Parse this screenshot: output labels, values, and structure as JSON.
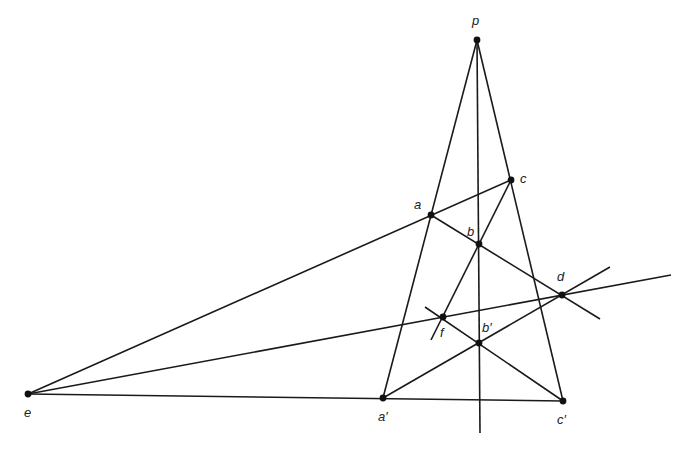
{
  "diagram": {
    "type": "projective-geometry-construction",
    "colors": {
      "line": "#1a1a1a",
      "point": "#111111",
      "label": "#222222"
    },
    "points": [
      {
        "id": "p",
        "label": "p",
        "x": 477,
        "y": 40,
        "lx": 472,
        "ly": 14
      },
      {
        "id": "c",
        "label": "c",
        "x": 511,
        "y": 180,
        "lx": 520,
        "ly": 172
      },
      {
        "id": "a",
        "label": "a",
        "x": 431,
        "y": 215,
        "lx": 414,
        "ly": 198
      },
      {
        "id": "b",
        "label": "b",
        "x": 479,
        "y": 244,
        "lx": 467,
        "ly": 225
      },
      {
        "id": "d",
        "label": "d",
        "x": 562,
        "y": 295,
        "lx": 557,
        "ly": 270
      },
      {
        "id": "f",
        "label": "f",
        "x": 443,
        "y": 317,
        "lx": 440,
        "ly": 326
      },
      {
        "id": "b2",
        "label": "b′",
        "x": 479,
        "y": 343,
        "lx": 482,
        "ly": 321
      },
      {
        "id": "e",
        "label": "e",
        "x": 28,
        "y": 394,
        "lx": 24,
        "ly": 406
      },
      {
        "id": "a2",
        "label": "a′",
        "x": 383,
        "y": 398,
        "lx": 378,
        "ly": 410
      },
      {
        "id": "c2",
        "label": "c′",
        "x": 563,
        "y": 401,
        "lx": 557,
        "ly": 413
      }
    ],
    "lines": [
      {
        "from": [
          477,
          40
        ],
        "to": [
          383,
          398
        ]
      },
      {
        "from": [
          477,
          40
        ],
        "to": [
          563,
          401
        ]
      },
      {
        "from": [
          477,
          40
        ],
        "to": [
          480,
          433
        ]
      },
      {
        "from": [
          28,
          394
        ],
        "to": [
          511,
          180
        ]
      },
      {
        "from": [
          28,
          394
        ],
        "to": [
          563,
          401
        ]
      },
      {
        "from": [
          28,
          394
        ],
        "to": [
          671,
          275
        ]
      },
      {
        "from": [
          431,
          215
        ],
        "to": [
          600,
          319
        ]
      },
      {
        "from": [
          511,
          180
        ],
        "to": [
          431,
          340
        ]
      },
      {
        "from": [
          383,
          398
        ],
        "to": [
          610,
          267
        ]
      },
      {
        "from": [
          425,
          307
        ],
        "to": [
          563,
          401
        ]
      }
    ]
  }
}
